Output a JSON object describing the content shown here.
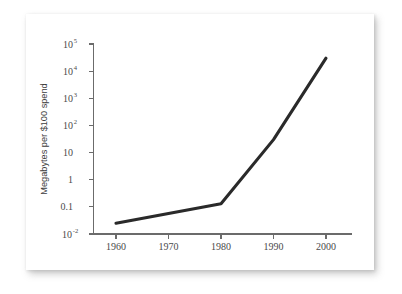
{
  "chart_data": {
    "type": "line",
    "title": "",
    "subtitle": "",
    "xlabel": "",
    "ylabel": "Megabytes per $100 spend",
    "x": [
      1960,
      1980,
      1990,
      2000
    ],
    "values": [
      0.025,
      0.13,
      30,
      30000
    ],
    "series": [
      {
        "name": "Megabytes per $100 spend",
        "x": [
          1960,
          1980,
          1990,
          2000
        ],
        "values": [
          0.025,
          0.13,
          30,
          30000
        ]
      }
    ],
    "xlim": [
      1955,
      2005
    ],
    "ylim": [
      0.01,
      100000
    ],
    "yscale": "log",
    "xscale": "linear",
    "grid": false,
    "legend": false,
    "legend_position": "none",
    "line_color": "#2a2a2a",
    "axis_color": "#6b6b6b",
    "background_color": "#ffffff",
    "x_ticks": [
      {
        "value": 1960,
        "label": "1960"
      },
      {
        "value": 1970,
        "label": "1970"
      },
      {
        "value": 1980,
        "label": "1980"
      },
      {
        "value": 1990,
        "label": "1990"
      },
      {
        "value": 2000,
        "label": "2000"
      }
    ],
    "y_ticks": [
      {
        "value": 0.01,
        "base": "10",
        "exponent": "-2",
        "label": "10-2"
      },
      {
        "value": 0.1,
        "base": "0.1",
        "exponent": "",
        "label": "0.1"
      },
      {
        "value": 1,
        "base": "1",
        "exponent": "",
        "label": "1"
      },
      {
        "value": 10,
        "base": "10",
        "exponent": "",
        "label": "10"
      },
      {
        "value": 100,
        "base": "10",
        "exponent": "2",
        "label": "102"
      },
      {
        "value": 1000,
        "base": "10",
        "exponent": "3",
        "label": "103"
      },
      {
        "value": 10000,
        "base": "10",
        "exponent": "4",
        "label": "104"
      },
      {
        "value": 100000,
        "base": "10",
        "exponent": "5",
        "label": "105"
      }
    ],
    "annotations": []
  }
}
